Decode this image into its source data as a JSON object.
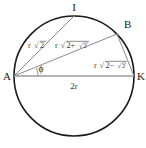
{
  "figure": {
    "type": "geometry-diagram",
    "colors": {
      "circle_stroke": "#1a1a1a",
      "chord_stroke": "#8a8a8a",
      "diameter_stroke": "#9a9a9a",
      "label_text": "#2a2a2a",
      "background": "#ffffff"
    },
    "circle": {
      "center_x": 74,
      "center_y": 76,
      "radius": 60,
      "diameter_label": "2r"
    },
    "vertices": [
      {
        "name": "A",
        "label": "A",
        "x": 14,
        "y": 76
      },
      {
        "name": "I",
        "label": "I",
        "x": 74,
        "y": 16
      },
      {
        "name": "B",
        "label": "B",
        "x": 117,
        "y": 34
      },
      {
        "name": "K",
        "label": "K",
        "x": 134,
        "y": 76
      }
    ],
    "segments": [
      {
        "name": "chord-AI",
        "from": "A",
        "to": "I",
        "label_prefix": "r",
        "label_radicand": "2",
        "label_nested": ""
      },
      {
        "name": "chord-AB",
        "from": "A",
        "to": "B",
        "label_prefix": "r",
        "label_radicand": "2+",
        "label_nested": "2"
      },
      {
        "name": "chord-BK",
        "from": "B",
        "to": "K",
        "label_prefix": "r",
        "label_radicand": "2−",
        "label_nested": "2"
      },
      {
        "name": "diameter-AK",
        "from": "A",
        "to": "K",
        "label_prefix": "2r",
        "label_radicand": "",
        "label_nested": ""
      }
    ],
    "angle": {
      "name": "angle-phi-at-A",
      "symbol": "ϕ",
      "vertex": "A",
      "between": [
        "A-B",
        "A-K"
      ]
    },
    "radical_glyph": "√"
  }
}
